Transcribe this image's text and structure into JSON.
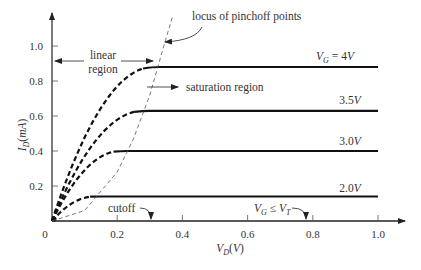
{
  "chart_data": {
    "type": "line",
    "title": "",
    "xlabel": "V_D(V)",
    "ylabel": "I_D(mA)",
    "xlim": [
      0,
      1.0
    ],
    "ylim": [
      0,
      1.1
    ],
    "x_ticks": [
      0.2,
      0.4,
      0.6,
      0.8,
      1.0
    ],
    "x_tick_labels": [
      "0.2",
      "0.4",
      "0.6",
      "0.8",
      "1.0"
    ],
    "y_ticks": [
      0.2,
      0.4,
      0.6,
      0.8,
      1.0
    ],
    "y_tick_labels": [
      "0.2",
      "0.4",
      "0.6",
      "0.8",
      "1.0"
    ],
    "origin_label": "0",
    "grid": false,
    "series": [
      {
        "name": "V_G = 4V",
        "label_main": "V",
        "label_sub": "G",
        "label_rest": " = 4V",
        "saturation_vd": 0.31,
        "saturation_id": 0.88
      },
      {
        "name": "3.5V",
        "label_main": "3.5V",
        "label_sub": "",
        "label_rest": "",
        "saturation_vd": 0.28,
        "saturation_id": 0.63
      },
      {
        "name": "3.0V",
        "label_main": "3.0V",
        "label_sub": "",
        "label_rest": "",
        "saturation_vd": 0.21,
        "saturation_id": 0.4
      },
      {
        "name": "2.0V",
        "label_main": "2.0V",
        "label_sub": "",
        "label_rest": "",
        "saturation_vd": 0.13,
        "saturation_id": 0.14
      },
      {
        "name": "V_G ≤ V_T",
        "label_main": "V",
        "label_sub": "G",
        "label_rest": " ≤ V",
        "label_sub2": "T",
        "saturation_vd": 0,
        "saturation_id": 0
      }
    ],
    "pinchoff_locus": {
      "x": [
        0,
        0.1,
        0.2,
        0.25,
        0.3,
        0.34,
        0.37
      ],
      "y": [
        0,
        0.06,
        0.28,
        0.47,
        0.72,
        0.98,
        1.17
      ]
    },
    "annotations": {
      "linear_region": [
        "linear",
        "region"
      ],
      "saturation_region": "saturation region",
      "locus": "locus of pinchoff points",
      "cutoff": "cutoff"
    }
  }
}
